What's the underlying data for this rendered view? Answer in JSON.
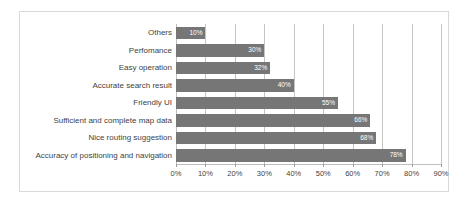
{
  "chart_data": {
    "type": "bar",
    "orientation": "horizontal",
    "title": "",
    "xlabel": "",
    "ylabel": "",
    "categories": [
      "Accuracy of positioning and navigation",
      "Nice routing suggestion",
      "Sufficient and complete map data",
      "Friendly UI",
      "Accurate search result",
      "Easy operation",
      "Perfomance",
      "Others"
    ],
    "values": [
      78,
      68,
      66,
      55,
      40,
      32,
      30,
      10
    ],
    "value_labels": [
      "78%",
      "68%",
      "66%",
      "55%",
      "40%",
      "32%",
      "30%",
      "10%"
    ],
    "xlim": [
      0,
      90
    ],
    "xticks": [
      0,
      10,
      20,
      30,
      40,
      50,
      60,
      70,
      80,
      90
    ],
    "xtick_labels": [
      "0%",
      "10%",
      "20%",
      "30%",
      "40%",
      "50%",
      "60%",
      "70%",
      "80%",
      "90%"
    ],
    "grid": true,
    "grid_axis": "x",
    "legend": false,
    "bar_color": "#767676",
    "value_label_color": "#ffffff",
    "axis_text_color": "#3f3f3f",
    "gridline_color": "#c4c4c4",
    "plot_background": "#ffffff",
    "frame_border_color": "#d9d9d9"
  }
}
